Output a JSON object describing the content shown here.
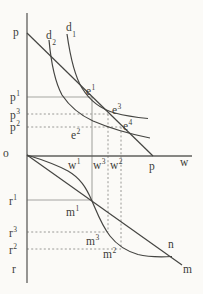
{
  "figure": {
    "type": "economics-quadrant-diagram",
    "colors": {
      "background": "#fbfaf7",
      "axis_ink": "#5f5f5c",
      "curve_ink": "#454542",
      "guide_solid": "#a6a6a2",
      "guide_dotted": "#8f8f8b",
      "text_ink": "#3c3c38"
    },
    "curves": [
      {
        "id": "d1-curve",
        "label": "d1"
      },
      {
        "id": "d2-curve",
        "label": "d2"
      },
      {
        "id": "p-line",
        "label": "p"
      },
      {
        "id": "n-curve",
        "label": "n"
      },
      {
        "id": "m-line",
        "label": "m"
      }
    ]
  },
  "labels": {
    "p_top": {
      "base": "p"
    },
    "d_2": {
      "base": "d",
      "sub": "2"
    },
    "d_1": {
      "base": "d",
      "sub": "1"
    },
    "p_1": {
      "base": "p",
      "sup": "1"
    },
    "p_3": {
      "base": "p",
      "sup": "3"
    },
    "p_2": {
      "base": "p",
      "sup": "2"
    },
    "e_1": {
      "base": "e",
      "sup": "1"
    },
    "e_3": {
      "base": "e",
      "sup": "3"
    },
    "e_4": {
      "base": "e",
      "sup": "4"
    },
    "e_2": {
      "base": "e",
      "sup": "2"
    },
    "o": {
      "base": "o"
    },
    "w_1": {
      "base": "w",
      "sup": "1"
    },
    "w_3": {
      "base": "w",
      "sup": "3"
    },
    "w_2": {
      "base": "w",
      "sup": "2"
    },
    "p_point": {
      "base": "p"
    },
    "w_end": {
      "base": "w"
    },
    "r_1": {
      "base": "r",
      "sup": "1"
    },
    "m_1": {
      "base": "m",
      "sup": "1"
    },
    "r_3": {
      "base": "r",
      "sup": "3"
    },
    "m_3": {
      "base": "m",
      "sup": "3"
    },
    "r_2": {
      "base": "r",
      "sup": "2"
    },
    "m_2": {
      "base": "m",
      "sup": "2"
    },
    "n_point": {
      "base": "n"
    },
    "m_end": {
      "base": "m"
    },
    "r_bottom": {
      "base": "r"
    }
  }
}
